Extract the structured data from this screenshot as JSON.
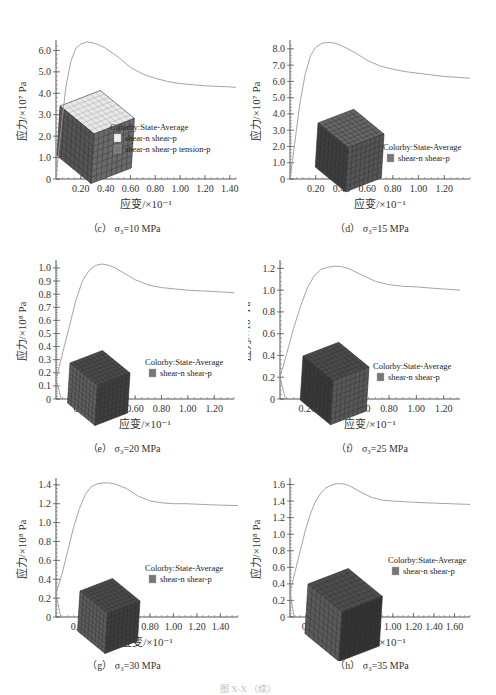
{
  "figure_caption": "图 X-X  （续）",
  "common": {
    "xlabel": "应变/×10⁻¹",
    "legend_title": "Colorby:State-Average"
  },
  "chart_data": [
    {
      "id": "c",
      "type": "line",
      "caption": "（c） σ₃=10 MPa",
      "title": "",
      "xlabel": "应变/×10⁻¹",
      "ylabel": "应力/×10⁷ Pa",
      "xlim": [
        0,
        1.45
      ],
      "ylim": [
        0,
        6.3
      ],
      "xticks": [
        0.2,
        0.4,
        0.6,
        0.8,
        1.0,
        1.2,
        1.4
      ],
      "xtick_labels": [
        "0.20",
        "0.40",
        "0.60",
        "0.80",
        "1.00",
        "1.20",
        "1.40"
      ],
      "yticks": [
        0,
        1.0,
        2.0,
        3.0,
        4.0,
        5.0,
        6.0
      ],
      "ytick_labels": [
        "0",
        "1.0",
        "2.0",
        "3.0",
        "4.0",
        "5.0",
        "6.0"
      ],
      "grid": false,
      "legend": {
        "title": "Colorby:State-Average",
        "items": [
          {
            "label": "shear-n shear-p",
            "color": "#eeeeee"
          },
          {
            "label": "shear-n shear-p tension-p",
            "color": "#777777"
          }
        ]
      },
      "series": [
        {
          "name": "stress-strain",
          "x": [
            0,
            0.02,
            0.05,
            0.08,
            0.12,
            0.16,
            0.2,
            0.25,
            0.3,
            0.35,
            0.4,
            0.5,
            0.6,
            0.7,
            0.8,
            0.9,
            1.0,
            1.1,
            1.2,
            1.3,
            1.4,
            1.45
          ],
          "y": [
            0,
            1.2,
            2.8,
            4.3,
            5.5,
            6.1,
            6.3,
            6.4,
            6.35,
            6.25,
            6.1,
            5.7,
            5.2,
            4.9,
            4.7,
            4.55,
            4.45,
            4.4,
            4.35,
            4.32,
            4.3,
            4.28
          ]
        }
      ],
      "inset": {
        "type": "cube",
        "faces": [
          "#e8e8e8",
          "#555555",
          "#6a6a6a"
        ]
      }
    },
    {
      "id": "d",
      "type": "line",
      "caption": "（d） σ₃=15 MPa",
      "title": "",
      "xlabel": "应变/×10⁻¹",
      "ylabel": "应力/×10⁷ Pa",
      "xlim": [
        0,
        1.4
      ],
      "ylim": [
        0,
        8.3
      ],
      "xticks": [
        0.2,
        0.4,
        0.6,
        0.8,
        1.0,
        1.2
      ],
      "xtick_labels": [
        "0.20",
        "0.40",
        "0.60",
        "0.80",
        "1.00",
        "1.20"
      ],
      "yticks": [
        0,
        1.0,
        2.0,
        3.0,
        4.0,
        5.0,
        6.0,
        7.0,
        8.0
      ],
      "ytick_labels": [
        "0",
        "1.0",
        "2.0",
        "3.0",
        "4.0",
        "5.0",
        "6.0",
        "7.0",
        "8.0"
      ],
      "grid": false,
      "legend": {
        "title": "Colorby:State-Average",
        "items": [
          {
            "label": "shear-n shear-p",
            "color": "#777777"
          }
        ]
      },
      "series": [
        {
          "name": "stress-strain",
          "x": [
            0,
            0.02,
            0.05,
            0.08,
            0.12,
            0.16,
            0.2,
            0.25,
            0.3,
            0.35,
            0.4,
            0.5,
            0.6,
            0.7,
            0.8,
            0.9,
            1.0,
            1.1,
            1.2,
            1.3,
            1.4
          ],
          "y": [
            0,
            1.2,
            3.0,
            4.8,
            6.5,
            7.6,
            8.1,
            8.35,
            8.4,
            8.35,
            8.2,
            7.8,
            7.3,
            6.95,
            6.75,
            6.6,
            6.5,
            6.4,
            6.3,
            6.25,
            6.2
          ]
        }
      ],
      "inset": {
        "type": "cube",
        "faces": [
          "#666666",
          "#3e3e3e",
          "#555555"
        ]
      }
    },
    {
      "id": "e",
      "type": "line",
      "caption": "（e） σ₃=20 MPa",
      "title": "",
      "xlabel": "应变/×10⁻¹",
      "ylabel": "应力/×10⁸ Pa",
      "xlim": [
        0,
        1.35
      ],
      "ylim": [
        0,
        1.03
      ],
      "xticks": [
        0.2,
        0.4,
        0.6,
        0.8,
        1.0,
        1.2
      ],
      "xtick_labels": [
        "0.20",
        "0.40",
        "0.60",
        "0.80",
        "1.00",
        "1.20"
      ],
      "yticks": [
        0,
        0.1,
        0.2,
        0.3,
        0.4,
        0.5,
        0.6,
        0.7,
        0.8,
        0.9,
        1.0
      ],
      "ytick_labels": [
        "0",
        "0.1",
        "0.2",
        "0.3",
        "0.4",
        "0.5",
        "0.6",
        "0.7",
        "0.8",
        "0.9",
        "1.0"
      ],
      "grid": false,
      "legend": {
        "title": "Colorby:State-Average",
        "items": [
          {
            "label": "shear-n shear-p",
            "color": "#777777"
          }
        ]
      },
      "series": [
        {
          "name": "stress-strain",
          "x": [
            0,
            0.05,
            0.1,
            0.15,
            0.2,
            0.25,
            0.3,
            0.35,
            0.4,
            0.45,
            0.5,
            0.6,
            0.7,
            0.8,
            0.9,
            1.0,
            1.1,
            1.2,
            1.35
          ],
          "y": [
            0.15,
            0.35,
            0.55,
            0.75,
            0.9,
            0.98,
            1.02,
            1.03,
            1.02,
            1.0,
            0.97,
            0.91,
            0.87,
            0.85,
            0.84,
            0.83,
            0.825,
            0.82,
            0.81
          ]
        }
      ],
      "inset": {
        "type": "cube",
        "faces": [
          "#4a4a4a",
          "#5e5e5e",
          "#3e3e3e"
        ]
      }
    },
    {
      "id": "f",
      "type": "line",
      "caption": "（f） σ₃=25 MPa",
      "title": "",
      "xlabel": "应变/×10⁻¹",
      "ylabel": "应力/×10⁸ Pa",
      "xlim": [
        0,
        1.32
      ],
      "ylim": [
        0,
        1.24
      ],
      "xticks": [
        0.2,
        0.4,
        0.6,
        0.8,
        1.0,
        1.2
      ],
      "xtick_labels": [
        "0.20",
        "0.40",
        "0.60",
        "0.80",
        "1.00",
        "1.20"
      ],
      "yticks": [
        0,
        0.2,
        0.4,
        0.6,
        0.8,
        1.0,
        1.2
      ],
      "ytick_labels": [
        "0",
        "0.2",
        "0.4",
        "0.6",
        "0.8",
        "1.0",
        "1.2"
      ],
      "grid": false,
      "legend": {
        "title": "Colorby:State-Average",
        "items": [
          {
            "label": "shear-n shear-p",
            "color": "#777777"
          }
        ]
      },
      "series": [
        {
          "name": "stress-strain",
          "x": [
            0,
            0.05,
            0.1,
            0.15,
            0.2,
            0.25,
            0.3,
            0.35,
            0.4,
            0.45,
            0.5,
            0.6,
            0.7,
            0.8,
            0.9,
            1.0,
            1.1,
            1.2,
            1.32
          ],
          "y": [
            0.2,
            0.42,
            0.65,
            0.85,
            1.02,
            1.13,
            1.19,
            1.21,
            1.22,
            1.215,
            1.2,
            1.14,
            1.08,
            1.05,
            1.035,
            1.03,
            1.02,
            1.01,
            1.0
          ]
        }
      ],
      "inset": {
        "type": "cube",
        "faces": [
          "#4a4a4a",
          "#383838",
          "#585858"
        ]
      }
    },
    {
      "id": "g",
      "type": "line",
      "caption": "（g） σ₃=30 MPa",
      "title": "",
      "xlabel": "应变/×10⁻¹",
      "ylabel": "应力/×10⁸ Pa",
      "xlim": [
        0,
        1.55
      ],
      "ylim": [
        0,
        1.43
      ],
      "xticks": [
        0.2,
        0.4,
        0.6,
        0.8,
        1.0,
        1.2,
        1.4
      ],
      "xtick_labels": [
        "0.20",
        "0.40",
        "0.60",
        "0.80",
        "1.00",
        "1.20",
        "1.40"
      ],
      "yticks": [
        0,
        0.2,
        0.4,
        0.6,
        0.8,
        1.0,
        1.2,
        1.4
      ],
      "ytick_labels": [
        "0",
        "0.2",
        "0.4",
        "0.6",
        "0.8",
        "1.0",
        "1.2",
        "1.4"
      ],
      "grid": false,
      "legend": {
        "title": "Colorby:State-Average",
        "items": [
          {
            "label": "shear-n shear-p",
            "color": "#777777"
          }
        ]
      },
      "series": [
        {
          "name": "stress-strain",
          "x": [
            0,
            0.05,
            0.1,
            0.15,
            0.2,
            0.25,
            0.3,
            0.35,
            0.4,
            0.45,
            0.5,
            0.6,
            0.7,
            0.8,
            0.9,
            1.0,
            1.1,
            1.2,
            1.3,
            1.4,
            1.55
          ],
          "y": [
            0.25,
            0.45,
            0.7,
            0.95,
            1.15,
            1.3,
            1.38,
            1.41,
            1.42,
            1.42,
            1.41,
            1.36,
            1.28,
            1.23,
            1.21,
            1.2,
            1.2,
            1.195,
            1.19,
            1.185,
            1.18
          ]
        }
      ],
      "inset": {
        "type": "cube",
        "faces": [
          "#4a4a4a",
          "#5c5c5c",
          "#3c3c3c"
        ]
      }
    },
    {
      "id": "h",
      "type": "line",
      "caption": "（h） σ₃=35 MPa",
      "title": "",
      "xlabel": "应变/×10⁻¹",
      "ylabel": "应力/×10⁸ Pa",
      "xlim": [
        0,
        1.75
      ],
      "ylim": [
        0,
        1.63
      ],
      "xticks": [
        0.2,
        0.4,
        0.6,
        0.8,
        1.0,
        1.2,
        1.4,
        1.6
      ],
      "xtick_labels": [
        "0.20",
        "0.40",
        "0.60",
        "0.80",
        "1.00",
        "1.20",
        "1.40",
        "1.60"
      ],
      "yticks": [
        0,
        0.2,
        0.4,
        0.6,
        0.8,
        1.0,
        1.2,
        1.4,
        1.6
      ],
      "ytick_labels": [
        "0",
        "0.2",
        "0.4",
        "0.6",
        "0.8",
        "1.0",
        "1.2",
        "1.4",
        "1.6"
      ],
      "grid": false,
      "legend": {
        "title": "Colorby:State-Average",
        "items": [
          {
            "label": "shear-n shear-p",
            "color": "#777777"
          }
        ]
      },
      "series": [
        {
          "name": "stress-strain",
          "x": [
            0,
            0.05,
            0.1,
            0.15,
            0.2,
            0.25,
            0.3,
            0.35,
            0.4,
            0.45,
            0.5,
            0.55,
            0.6,
            0.7,
            0.8,
            0.9,
            1.0,
            1.2,
            1.4,
            1.6,
            1.75
          ],
          "y": [
            0.3,
            0.55,
            0.8,
            1.05,
            1.25,
            1.4,
            1.5,
            1.56,
            1.59,
            1.61,
            1.61,
            1.6,
            1.57,
            1.5,
            1.44,
            1.41,
            1.4,
            1.385,
            1.375,
            1.365,
            1.36
          ]
        }
      ],
      "inset": {
        "type": "cube",
        "faces": [
          "#4d4d4d",
          "#5a5a5a",
          "#333333"
        ]
      }
    }
  ]
}
